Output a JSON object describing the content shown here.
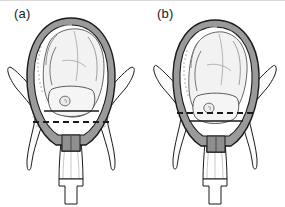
{
  "figure": {
    "type": "medical-line-illustration",
    "background_color": "#ffffff",
    "ink_color": "#1a1a1a",
    "uterine_wall_fill": "#9a9a9a",
    "uterine_cavity_fill": "#ffffff",
    "fetus_fill": "#f2f2f2",
    "bone_fill": "#fbfbfb",
    "shading_gray": "#cfcfcf",
    "panels": [
      {
        "id": "a",
        "label": "(a)",
        "description": "Fetal head not engaged - widest diameter above the ischial spine line",
        "solid_line_label": "biparietal-plane",
        "solid_line_y": 110,
        "dashed_line_label": "ischial-spines-plane",
        "dashed_line_y": 121,
        "lines_order": "solid above dashed"
      },
      {
        "id": "b",
        "label": "(b)",
        "description": "Fetal head engaged - widest diameter at or below the ischial spine line",
        "solid_line_label": "biparietal-plane",
        "solid_line_y": 120,
        "dashed_line_label": "ischial-spines-plane",
        "dashed_line_y": 112,
        "lines_order": "dashed above solid"
      }
    ],
    "structures": [
      "uterus",
      "uterine-cavity",
      "fetus",
      "fetal-head",
      "fetal-ear",
      "umbilical-cord",
      "cervix",
      "vagina",
      "perineum",
      "left-ischium",
      "right-ischium",
      "left-ischial-spine",
      "right-ischial-spine"
    ]
  }
}
